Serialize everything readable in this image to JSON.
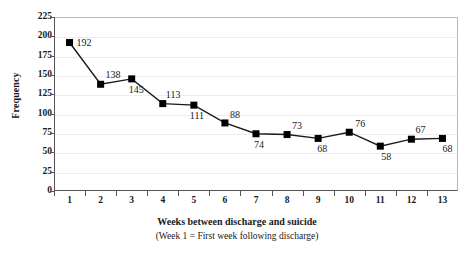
{
  "chart_data": {
    "type": "line",
    "title": "",
    "xlabel": "Weeks between discharge and suicide",
    "xsublabel": "(Week 1 =  First week following discharge)",
    "ylabel": "Frequency",
    "ylim": [
      0,
      225
    ],
    "ytick_step": 25,
    "grid": true,
    "legend": "none",
    "marker": "filled-square",
    "line_color": "#1a1a1a",
    "marker_color": "#000000",
    "categories": [
      "1",
      "2",
      "3",
      "4",
      "5",
      "6",
      "7",
      "8",
      "9",
      "10",
      "11",
      "12",
      "13"
    ],
    "values": [
      192,
      138,
      145,
      113,
      111,
      88,
      74,
      73,
      68,
      76,
      58,
      67,
      68
    ],
    "yticks": [
      "0",
      "25",
      "50",
      "75",
      "100",
      "125",
      "150",
      "175",
      "200",
      "225"
    ],
    "point_labels": [
      {
        "text": "192",
        "value": 192,
        "category": "1"
      },
      {
        "text": "138",
        "value": 138,
        "category": "2"
      },
      {
        "text": "145",
        "value": 145,
        "category": "3"
      },
      {
        "text": "113",
        "value": 113,
        "category": "4"
      },
      {
        "text": "111",
        "value": 111,
        "category": "5"
      },
      {
        "text": "88",
        "value": 88,
        "category": "6"
      },
      {
        "text": "74",
        "value": 74,
        "category": "7"
      },
      {
        "text": "73",
        "value": 73,
        "category": "8"
      },
      {
        "text": "68",
        "value": 68,
        "category": "9"
      },
      {
        "text": "76",
        "value": 76,
        "category": "10"
      },
      {
        "text": "58",
        "value": 58,
        "category": "11"
      },
      {
        "text": "67",
        "value": 67,
        "category": "12"
      },
      {
        "text": "68",
        "value": 68,
        "category": "13"
      }
    ]
  }
}
